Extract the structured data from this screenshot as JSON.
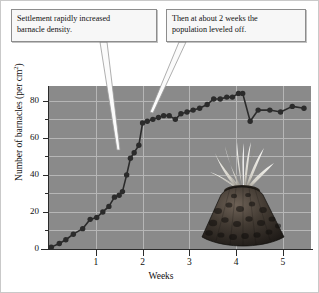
{
  "figure": {
    "background_color": "#ffffff",
    "plot_background_color": "#8a8a8a",
    "gridline_color": "#b6b6b6",
    "series_color": "#2b2b2b"
  },
  "callouts": [
    {
      "id": "callout-1",
      "line1": "Settlement rapidly increased",
      "line2": "barnacle density."
    },
    {
      "id": "callout-2",
      "line1": "Then at about 2 weeks the",
      "line2": "population leveled off."
    }
  ],
  "inset": {
    "caption": "barnacle-photograph"
  },
  "chart_data": {
    "type": "line",
    "title": "",
    "xlabel": "Weeks",
    "ylabel": "Number of barnacles (per cm",
    "ylabel_sup": "2",
    "ylabel_suffix": ")",
    "xlim": [
      0,
      5.6
    ],
    "ylim": [
      0,
      88
    ],
    "grid": true,
    "legend": "none",
    "xticks": [
      1,
      2,
      3,
      4,
      5
    ],
    "xticklabels": [
      "1",
      "2",
      "3",
      "4",
      "5"
    ],
    "yticks": [
      0,
      20,
      40,
      60,
      80
    ],
    "yticklabels": [
      "0",
      "20",
      "40",
      "60",
      "80"
    ],
    "yticks_minor": [
      10,
      30,
      50,
      70
    ],
    "series": [
      {
        "name": "Barnacle density",
        "marker": "filled-circle",
        "x": [
          0.05,
          0.22,
          0.36,
          0.52,
          0.72,
          0.88,
          1.02,
          1.15,
          1.28,
          1.4,
          1.5,
          1.57,
          1.66,
          1.74,
          1.82,
          1.92,
          2.0,
          2.1,
          2.22,
          2.34,
          2.45,
          2.57,
          2.7,
          2.82,
          2.95,
          3.08,
          3.22,
          3.38,
          3.52,
          3.66,
          3.8,
          3.92,
          4.05,
          4.14,
          4.3,
          4.47,
          4.72,
          4.95,
          5.2,
          5.45
        ],
        "y": [
          1,
          3,
          5,
          8,
          11,
          16,
          17,
          20,
          23,
          28,
          29,
          31,
          40,
          49,
          52,
          56,
          68,
          69,
          70,
          71,
          72,
          72,
          70,
          73,
          74,
          75,
          76,
          78,
          81,
          81,
          82,
          82,
          84,
          84,
          69,
          75,
          75,
          74,
          77,
          76
        ]
      }
    ],
    "annotations": [
      {
        "text": "Settlement rapidly increased barnacle density.",
        "points_to_x": 1.55,
        "points_to_y": 29
      },
      {
        "text": "Then at about 2 weeks the population leveled off.",
        "points_to_x": 2.05,
        "points_to_y": 70
      }
    ]
  }
}
